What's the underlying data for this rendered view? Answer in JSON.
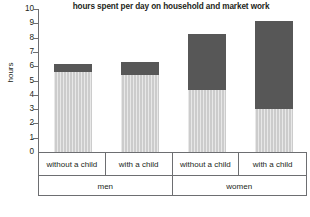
{
  "chart_data": {
    "type": "bar",
    "title": "hours spent per day on household and market work",
    "xlabel": "",
    "ylabel": "hours",
    "ylim": [
      0,
      10
    ],
    "ytick_labels": [
      "10",
      "9",
      "8",
      "7",
      "6",
      "5",
      "4",
      "3",
      "2",
      "1",
      "0"
    ],
    "ytick_values": [
      10,
      9,
      8,
      7,
      6,
      5,
      4,
      3,
      2,
      1,
      0
    ],
    "grid": false,
    "legend": "none",
    "stacked": true,
    "categories": [
      "without a child",
      "with a child",
      "without a child",
      "with a child"
    ],
    "groups": [
      {
        "label": "men",
        "span": 2
      },
      {
        "label": "women",
        "span": 2
      }
    ],
    "series": [
      {
        "name": "light-segment",
        "color": "#cccccc",
        "values": [
          5.7,
          5.45,
          4.4,
          3.1
        ]
      },
      {
        "name": "dark-segment",
        "color": "#575757",
        "values": [
          0.55,
          0.95,
          3.9,
          6.1
        ]
      }
    ],
    "totals": [
      6.25,
      6.4,
      8.3,
      9.2
    ]
  },
  "colors": {
    "light_segment": "#cccccc",
    "dark_segment": "#575757",
    "axis": "#6d6e71",
    "text": "#231f20",
    "background": "#ffffff"
  }
}
